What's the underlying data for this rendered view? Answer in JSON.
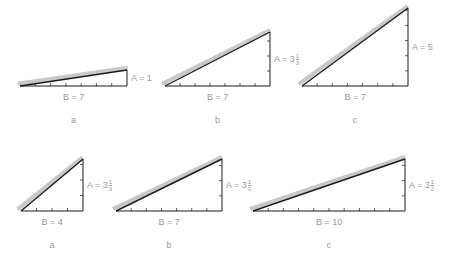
{
  "figure": {
    "style": {
      "line_color": "#1a1a1a",
      "hypotenuse_shadow_color": "#c8c8c8",
      "label_color": "#9a9a9a",
      "background": "#ffffff"
    },
    "rows": [
      {
        "name": "top-row",
        "triangles": [
          {
            "id": "a",
            "caption": "a",
            "B": 7,
            "A": "1",
            "B_label": "B = 7",
            "A_label_main": "A = 1",
            "A_frac": null,
            "x0": 20,
            "x1": 127,
            "y_base": 86,
            "y_top": 70,
            "a_ticks": 0
          },
          {
            "id": "b",
            "caption": "b",
            "B": 7,
            "A": "3 1/3",
            "B_label": "B = 7",
            "A_label_main": "A = 3",
            "A_frac": {
              "num": "1",
              "den": "3"
            },
            "x0": 165,
            "x1": 270,
            "y_base": 86,
            "y_top": 32,
            "a_ticks": 3
          },
          {
            "id": "c",
            "caption": "c",
            "B": 7,
            "A": "5",
            "B_label": "B = 7",
            "A_label_main": "A = 5",
            "A_frac": null,
            "x0": 302,
            "x1": 408,
            "y_base": 86,
            "y_top": 8,
            "a_ticks": 5
          }
        ]
      },
      {
        "name": "bottom-row",
        "triangles": [
          {
            "id": "a",
            "caption": "a",
            "B": 4,
            "A": "3 1/3",
            "B_label": "B = 4",
            "A_label_main": "A = 3",
            "A_frac": {
              "num": "1",
              "den": "3"
            },
            "x0": 21,
            "x1": 83,
            "y_base": 211,
            "y_top": 159,
            "a_ticks": 3
          },
          {
            "id": "b",
            "caption": "b",
            "B": 7,
            "A": "3 1/3",
            "B_label": "B = 7",
            "A_label_main": "A = 3",
            "A_frac": {
              "num": "1",
              "den": "3"
            },
            "x0": 116,
            "x1": 222,
            "y_base": 211,
            "y_top": 159,
            "a_ticks": 3
          },
          {
            "id": "c",
            "caption": "c",
            "B": 10,
            "A": "3 1/2",
            "B_label": "B = 10",
            "A_label_main": "A = 3",
            "A_frac": {
              "num": "1",
              "den": "2"
            },
            "x0": 253,
            "x1": 405,
            "y_base": 211,
            "y_top": 159,
            "a_ticks": 3
          }
        ]
      }
    ]
  }
}
